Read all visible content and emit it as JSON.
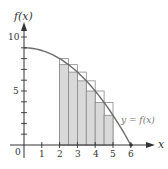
{
  "chart_data": {
    "type": "area",
    "title": "",
    "function_label": "y = f(x)",
    "xlabel": "x",
    "ylabel": "f(x)",
    "origin_label": "0",
    "xlim": [
      0,
      6.6
    ],
    "ylim": [
      0,
      11
    ],
    "x_ticks": [
      1,
      2,
      3,
      4,
      5,
      6
    ],
    "x_tick_labels": [
      "1",
      "2",
      "3",
      "4",
      "5",
      "6"
    ],
    "y_ticks": [
      1,
      2,
      3,
      4,
      5,
      6,
      7,
      8,
      9,
      10
    ],
    "y_tick_labels": [
      {
        "value": 5,
        "label": "5"
      },
      {
        "value": 10,
        "label": "10"
      }
    ],
    "curve": {
      "description": "decreasing concave-down curve from (0, 9) to (6, 0)",
      "x": [
        0,
        1,
        2,
        2.5,
        3,
        3.5,
        4,
        4.5,
        5,
        6
      ],
      "y": [
        9,
        8.75,
        8,
        7.44,
        6.75,
        5.94,
        5,
        3.94,
        2.75,
        0
      ]
    },
    "rectangles": {
      "description": "Riemann rectangles on [2, 5], width 0.5; outlined upper (left-endpoint) and shaded lower (right-endpoint)",
      "width": 0.5,
      "x_left": [
        2,
        2.5,
        3,
        3.5,
        4,
        4.5
      ],
      "upper_heights": [
        8,
        7.44,
        6.75,
        5.94,
        5,
        3.94
      ],
      "lower_heights": [
        7.44,
        6.75,
        5.94,
        5,
        3.94,
        2.75
      ]
    },
    "grid": false,
    "legend": null
  },
  "labels": {
    "ylabel": "f(x)",
    "xlabel": "x",
    "origin": "0",
    "y5": "5",
    "y10": "10",
    "x1": "1",
    "x2": "2",
    "x3": "3",
    "x4": "4",
    "x5": "5",
    "x6": "6",
    "func": "y = f(x)"
  },
  "colors": {
    "shade": "#d9d9d9",
    "outline": "#8a8a8a",
    "curve": "#6b6b6b",
    "axis": "#333333"
  }
}
